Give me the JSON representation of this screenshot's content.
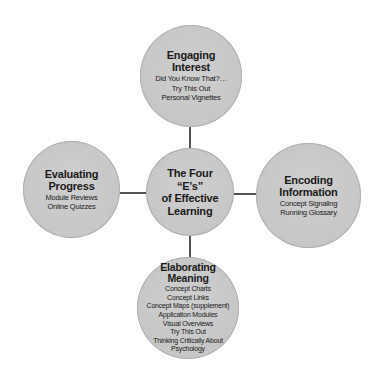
{
  "diagram": {
    "center": {
      "title_lines": [
        "The Four",
        "“E’s”",
        "of Effective",
        "Learning"
      ]
    },
    "nodes": {
      "top": {
        "title_lines": [
          "Engaging",
          "Interest"
        ],
        "items": [
          "Did You Know That?…",
          "Try This Out",
          "Personal Vignettes"
        ]
      },
      "left": {
        "title_lines": [
          "Evaluating",
          "Progress"
        ],
        "items": [
          "Module Reviews",
          "Online Quizzes"
        ]
      },
      "right": {
        "title_lines": [
          "Encoding",
          "Information"
        ],
        "items": [
          "Concept Signaling",
          "Running Glossary"
        ]
      },
      "bottom": {
        "title_lines": [
          "Elaborating",
          "Meaning"
        ],
        "items": [
          "Concept Charts",
          "Concept Links",
          "Concept Maps (supplement)",
          "Application Modules",
          "Visual Overviews",
          "Try This Out",
          "Thinking Critically About",
          "Psychology"
        ]
      }
    },
    "colors": {
      "circle_fill": "#c8c8c8",
      "connector": "#555555",
      "text": "#1a1a1a"
    }
  }
}
